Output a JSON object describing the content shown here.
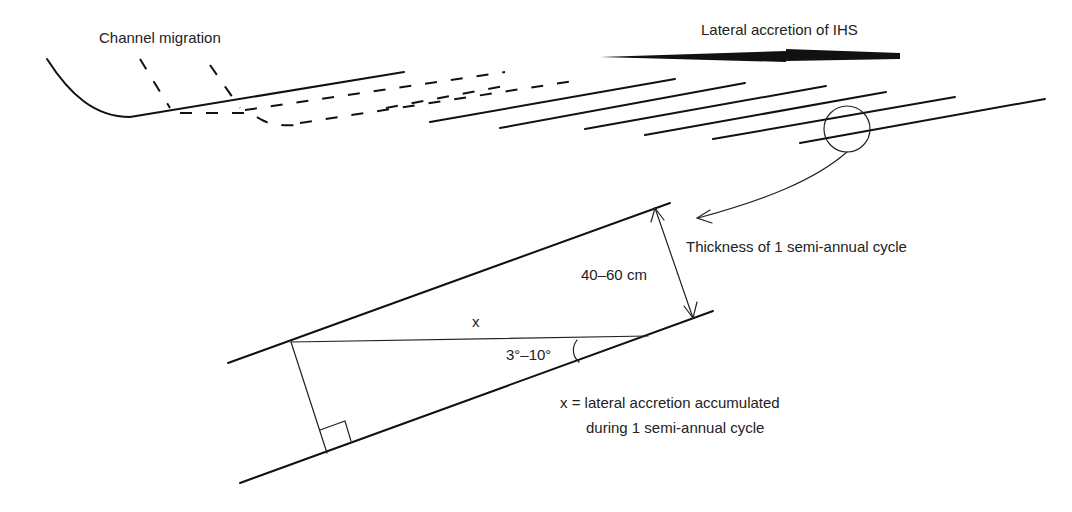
{
  "title_labels": {
    "channel_migration": "Channel migration",
    "lateral_accretion": "Lateral accretion of IHS"
  },
  "callout": {
    "thickness_label": "Thickness of 1 semi-annual cycle"
  },
  "detail": {
    "thickness_value": "40–60 cm",
    "x_label": "x",
    "angle_label": "3°–10°",
    "definition_line1": "x = lateral accretion accumulated",
    "definition_line2": "during 1 semi-annual cycle"
  },
  "colors": {
    "line": "#111111",
    "text": "#222222",
    "background": "#ffffff"
  }
}
